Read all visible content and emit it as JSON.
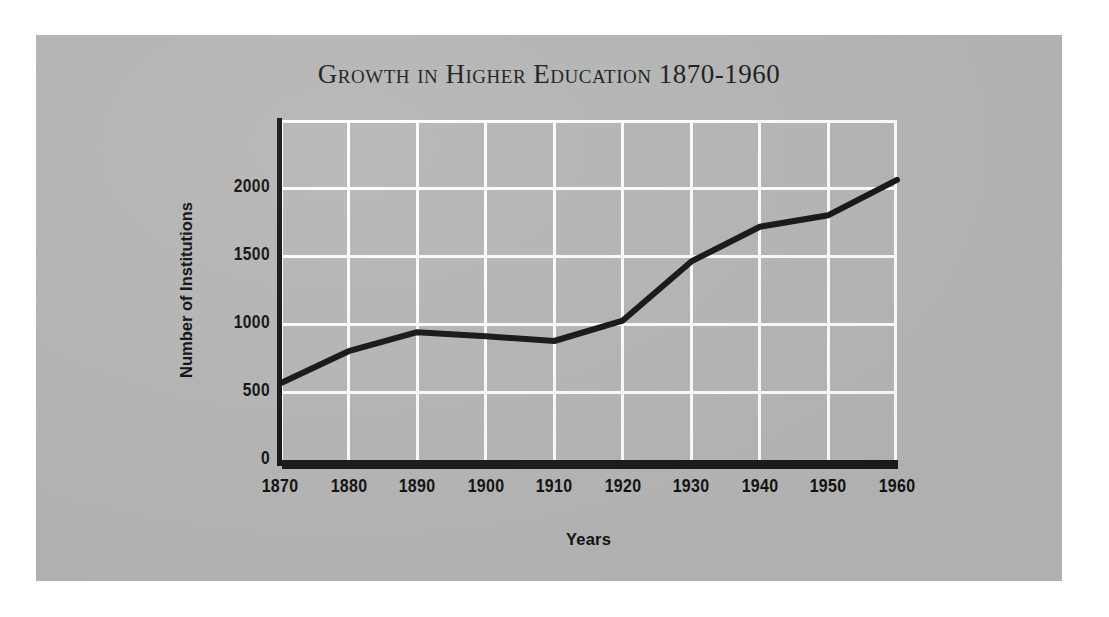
{
  "figure": {
    "background_color": "#ffffff",
    "panel_color": "#b6b6b6",
    "ink_color": "#161616",
    "gridline_color": "#fdfdfd"
  },
  "chart_data": {
    "type": "line",
    "title": "Growth in Higher Education 1870-1960",
    "xlabel": "Years",
    "ylabel": "Number of Institutions",
    "x": [
      1870,
      1880,
      1890,
      1900,
      1910,
      1920,
      1930,
      1940,
      1950,
      1960
    ],
    "categories": [
      "1870",
      "1880",
      "1890",
      "1900",
      "1910",
      "1920",
      "1930",
      "1940",
      "1950",
      "1960"
    ],
    "values": [
      563,
      800,
      940,
      910,
      875,
      1025,
      1460,
      1715,
      1800,
      2060
    ],
    "series": [
      {
        "name": "Number of Institutions",
        "values": [
          563,
          800,
          940,
          910,
          875,
          1025,
          1460,
          1715,
          1800,
          2060
        ]
      }
    ],
    "xlim": [
      1870,
      1960
    ],
    "ylim": [
      0,
      2500
    ],
    "xticks": [
      "1870",
      "1880",
      "1890",
      "1900",
      "1910",
      "1920",
      "1930",
      "1940",
      "1950",
      "1960"
    ],
    "yticks": [
      "0",
      "500",
      "1000",
      "1500",
      "2000"
    ],
    "ytick_values": [
      0,
      500,
      1000,
      1500,
      2000
    ],
    "grid": true,
    "legend": "none",
    "line_color": "#161616",
    "line_width": 6
  }
}
